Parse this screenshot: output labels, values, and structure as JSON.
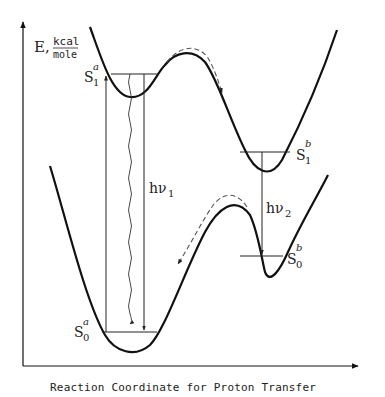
{
  "diagram": {
    "type": "potential-energy-diagram",
    "y_axis_label": {
      "symbol": "E,",
      "numerator": "kcal",
      "denominator": "mole"
    },
    "x_axis_label": "Reaction Coordinate for Proton Transfer",
    "states": {
      "S1a": {
        "base": "S",
        "sub": "1",
        "sup": "a"
      },
      "S1b": {
        "base": "S",
        "sub": "1",
        "sup": "b"
      },
      "S0a": {
        "base": "S",
        "sub": "0",
        "sup": "a"
      },
      "S0b": {
        "base": "S",
        "sub": "0",
        "sup": "b"
      }
    },
    "transitions": {
      "hv1": {
        "base": "hν",
        "sub": "1"
      },
      "hv2": {
        "base": "hν",
        "sub": "2"
      }
    },
    "colors": {
      "line": "#111111",
      "dashed": "#555555",
      "background": "#ffffff"
    }
  }
}
